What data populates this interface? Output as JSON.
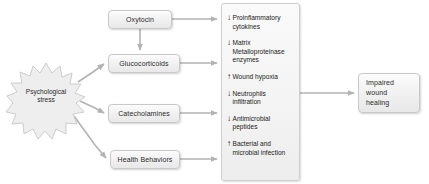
{
  "diagram": {
    "source_node": {
      "label_line1": "Psychological",
      "label_line2": "stress",
      "shape": "starburst"
    },
    "mediator_nodes": [
      {
        "id": "oxytocin",
        "label": "Oxytocin"
      },
      {
        "id": "glucocorticoids",
        "label": "Glucocorticoids"
      },
      {
        "id": "catecholamines",
        "label": "Catecholamines"
      },
      {
        "id": "health-behaviors",
        "label": "Health Behaviors"
      }
    ],
    "effects_panel": {
      "items": [
        {
          "arrow": "down",
          "arrow_glyph": "↓",
          "text": "Proinflammatory cytokines"
        },
        {
          "arrow": "down",
          "arrow_glyph": "↓",
          "text": "Matrix Metalloproteinase enzymes"
        },
        {
          "arrow": "up",
          "arrow_glyph": "↑",
          "text": "Wound hypoxia"
        },
        {
          "arrow": "down",
          "arrow_glyph": "↓",
          "text": "Neutrophils infiltration"
        },
        {
          "arrow": "down",
          "arrow_glyph": "↓",
          "text": "Antimicrobial peptides"
        },
        {
          "arrow": "up",
          "arrow_glyph": "↑",
          "text": "Bacterial and microbial infection"
        }
      ]
    },
    "outcome_node": {
      "label_line1": "Impaired",
      "label_line2": "wound",
      "label_line3": "healing"
    },
    "colors": {
      "node_fill": "#f2f2f2",
      "node_border": "#c8c8c8",
      "connector": "#b3b3b3",
      "text": "#2b2b2b",
      "background": "#ffffff"
    }
  }
}
